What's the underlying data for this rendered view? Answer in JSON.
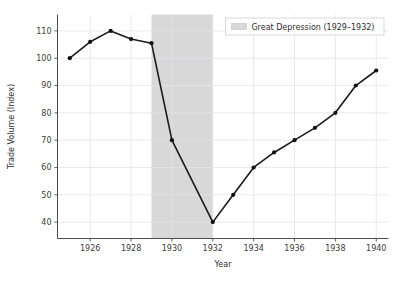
{
  "chart_data": {
    "type": "line",
    "title": "",
    "xlabel": "Year",
    "ylabel": "Trade Volume (Index)",
    "xlim": [
      1924.4,
      1940.6
    ],
    "ylim": [
      34,
      116
    ],
    "xticks": [
      1926,
      1928,
      1930,
      1932,
      1934,
      1936,
      1938,
      1940
    ],
    "xtick_labels": [
      "1926",
      "1928",
      "1930",
      "1932",
      "1934",
      "1936",
      "1938",
      "1940"
    ],
    "yticks": [
      40,
      50,
      60,
      70,
      80,
      90,
      100,
      110
    ],
    "ytick_labels": [
      "40",
      "50",
      "60",
      "70",
      "80",
      "90",
      "100",
      "110"
    ],
    "grid": true,
    "legend_position": "top-right",
    "x": [
      1925,
      1926,
      1927,
      1928,
      1929,
      1930,
      1932,
      1933,
      1934,
      1935,
      1936,
      1937,
      1938,
      1939,
      1940
    ],
    "series": [
      {
        "name": "Trade Volume (Index)",
        "color": "#1a1a1a",
        "marker": "circle",
        "values": [
          100,
          106,
          110,
          107,
          105.5,
          70,
          40,
          50,
          60,
          65.5,
          70,
          74.5,
          80,
          90,
          95.5
        ]
      }
    ],
    "shaded_regions": [
      {
        "label": "Great Depression (1929–1932)",
        "x_start": 1929,
        "x_end": 1932,
        "color": "#d8d8d8"
      }
    ]
  },
  "legend": {
    "entries": [
      {
        "label": "Great Depression (1929–1932)",
        "swatch_color": "#d8d8d8"
      }
    ]
  },
  "axes": {
    "x_title": "Year",
    "y_title": "Trade Volume (Index)"
  },
  "style": {
    "line_color": "#1a1a1a",
    "marker_color": "#111111",
    "grid_color": "#e3e3ea",
    "axis_color": "#4d4d4d",
    "band_color": "#d8d8d8",
    "legend_border": "#cfcfcf",
    "background": "#ffffff",
    "tick_text_color": "#3b3b3b"
  }
}
